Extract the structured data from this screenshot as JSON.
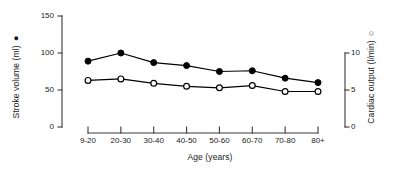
{
  "chart_data": {
    "type": "line",
    "title": "",
    "xlabel": "Age (years)",
    "categories": [
      "9-20",
      "20-30",
      "30-40",
      "40-50",
      "50-60",
      "60-70",
      "70-80",
      "80+"
    ],
    "grid": false,
    "legend_position": "axis-labels",
    "axes": {
      "left": {
        "label": "Stroke volume (ml)",
        "marker": "filled-circle",
        "marker_glyph": "●",
        "ticks": [
          0,
          50,
          100,
          150
        ],
        "tick_labels": [
          "0",
          "50",
          "100",
          "150"
        ],
        "ylim": [
          0,
          150
        ]
      },
      "right": {
        "label": "Cardiac output (l/min)",
        "marker": "open-circle",
        "marker_glyph": "○",
        "ticks": [
          0,
          5,
          10
        ],
        "tick_labels": [
          "0",
          "5",
          "10"
        ],
        "ylim": [
          0,
          10
        ]
      }
    },
    "series": [
      {
        "name": "Stroke volume (ml)",
        "axis": "left",
        "marker": "filled-circle",
        "color": "#000000",
        "values": [
          89,
          100,
          87,
          83,
          75,
          76,
          66,
          60
        ]
      },
      {
        "name": "Cardiac output (l/min)",
        "axis": "right",
        "marker": "open-circle",
        "color": "#000000",
        "values": [
          6.3,
          6.5,
          5.9,
          5.5,
          5.3,
          5.6,
          4.8,
          4.8
        ]
      }
    ]
  },
  "style": {
    "axis_color": "#3a3a3a",
    "ink": "#1a1a1a",
    "background": "#ffffff"
  }
}
